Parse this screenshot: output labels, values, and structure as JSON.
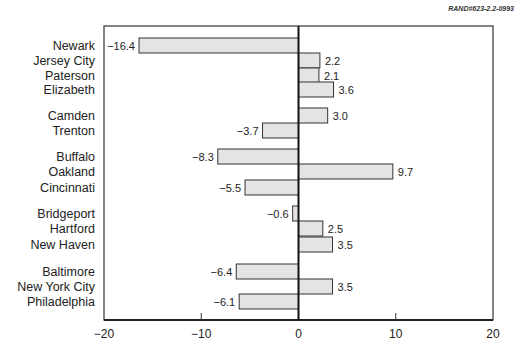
{
  "source_note": "RAND#623-2.2-0993",
  "chart_data": {
    "type": "bar",
    "orientation": "horizontal",
    "title": "",
    "xlabel": "",
    "ylabel": "",
    "xlim": [
      -20,
      20
    ],
    "x_ticks": [
      -20,
      -10,
      0,
      10,
      20
    ],
    "x_tick_labels": [
      "−20",
      "−10",
      "0",
      "10",
      "20"
    ],
    "grid": false,
    "legend": null,
    "bar_fill": "#e4e4e4",
    "bar_stroke": "#333333",
    "groups": [
      [
        "Newark",
        "Jersey City",
        "Paterson",
        "Elizabeth"
      ],
      [
        "Camden",
        "Trenton"
      ],
      [
        "Buffalo",
        "Oakland",
        "Cincinnati"
      ],
      [
        "Bridgeport",
        "Hartford",
        "New Haven"
      ],
      [
        "Baltimore",
        "New York City",
        "Philadelphia"
      ]
    ],
    "categories": [
      "Newark",
      "Jersey City",
      "Paterson",
      "Elizabeth",
      "Camden",
      "Trenton",
      "Buffalo",
      "Oakland",
      "Cincinnati",
      "Bridgeport",
      "Hartford",
      "New Haven",
      "Baltimore",
      "New York City",
      "Philadelphia"
    ],
    "values": [
      -16.4,
      2.2,
      2.1,
      3.6,
      3.0,
      -3.7,
      -8.3,
      9.7,
      -5.5,
      -0.6,
      2.5,
      3.5,
      -6.4,
      3.5,
      -6.1
    ],
    "value_labels": [
      "−16.4",
      "2.2",
      "2.1",
      "3.6",
      "3.0",
      "−3.7",
      "−8.3",
      "9.7",
      "−5.5",
      "−0.6",
      "2.5",
      "3.5",
      "−6.4",
      "3.5",
      "−6.1"
    ],
    "row_y_top": [
      38,
      53,
      68,
      82,
      108,
      123,
      149,
      164,
      180,
      206,
      221,
      237,
      264,
      279,
      294
    ],
    "bar_height": 15
  }
}
